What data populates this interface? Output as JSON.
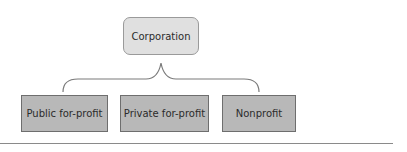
{
  "diagram": {
    "type": "hierarchy",
    "root": {
      "label": "Corporation"
    },
    "connector": "curly-brace",
    "children": [
      {
        "label": "Public for-profit"
      },
      {
        "label": "Private for-profit"
      },
      {
        "label": "Nonprofit"
      }
    ]
  },
  "colors": {
    "root_fill": "#e0e0e0",
    "child_fill": "#b8b8b8",
    "connector": "#7a7a7a"
  }
}
